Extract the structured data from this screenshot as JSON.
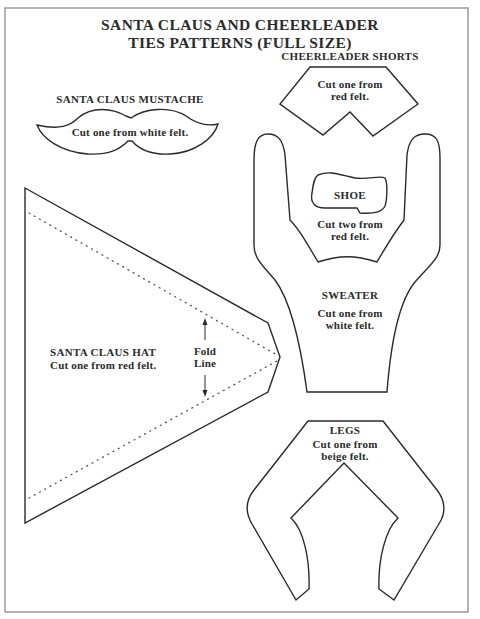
{
  "title": {
    "line1": "SANTA CLAUS AND CHEERLEADER",
    "line2": "TIES PATTERNS (FULL SIZE)"
  },
  "patterns": {
    "mustache": {
      "label": "SANTA CLAUS MUSTACHE",
      "instruction": "Cut one from white felt."
    },
    "shorts": {
      "label": "CHEERLEADER SHORTS",
      "instruction_line1": "Cut one from",
      "instruction_line2": "red felt."
    },
    "shoe": {
      "label": "SHOE",
      "instruction_line1": "Cut two from",
      "instruction_line2": "red felt."
    },
    "sweater": {
      "label": "SWEATER",
      "instruction_line1": "Cut one from",
      "instruction_line2": "white felt."
    },
    "hat": {
      "label": "SANTA CLAUS HAT",
      "instruction": "Cut one from red felt.",
      "fold_line_1": "Fold",
      "fold_line_2": "Line"
    },
    "legs": {
      "label": "LEGS",
      "instruction_line1": "Cut one from",
      "instruction_line2": "beige felt."
    }
  },
  "colors": {
    "line": "#2a2a2a",
    "border": "#9a9a9a",
    "background": "#ffffff"
  }
}
